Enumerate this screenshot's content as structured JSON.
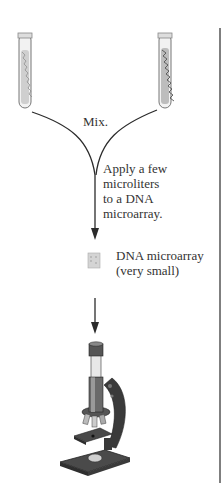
{
  "diagram": {
    "type": "workflow",
    "steps": [
      {
        "id": "tube-left",
        "kind": "test-tube",
        "label": ""
      },
      {
        "id": "tube-right",
        "kind": "test-tube",
        "label": ""
      },
      {
        "id": "mix",
        "label": "Mix."
      },
      {
        "id": "apply",
        "label_lines": [
          "Apply a few",
          "microliters",
          "to a DNA",
          "microarray."
        ]
      },
      {
        "id": "microarray",
        "label_lines": [
          "DNA microarray",
          "(very small)"
        ]
      },
      {
        "id": "microscope",
        "kind": "microscope",
        "label": ""
      }
    ],
    "colors": {
      "line": "#2b2b2b",
      "tube_fill": "#e6e6e6",
      "microscope_dark": "#3a3a3a",
      "microscope_mid": "#8a8a8a",
      "border": "#555555"
    }
  }
}
